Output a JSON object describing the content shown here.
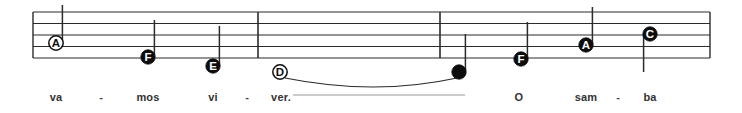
{
  "score": {
    "staff": {
      "left_x": 33,
      "right_x": 710,
      "top_y": 12,
      "line_spacing": 11.5,
      "line_count": 5,
      "line_color": "#2b2b2b"
    },
    "barlines": [
      {
        "name": "barline-1",
        "x": 258
      },
      {
        "name": "barline-2",
        "x": 440
      }
    ],
    "notes": [
      {
        "id": "note-a-1",
        "letter": "A",
        "filled": false,
        "x": 56,
        "y": 43,
        "stem": "up",
        "stem_length": 38,
        "lyric": "va"
      },
      {
        "id": "note-f-1",
        "letter": "F",
        "filled": true,
        "x": 148,
        "y": 57,
        "stem": "up",
        "stem_length": 37,
        "lyric": "mos"
      },
      {
        "id": "note-e-1",
        "letter": "E",
        "filled": true,
        "x": 213,
        "y": 66,
        "stem": "up",
        "stem_length": 40,
        "lyric": "vi"
      },
      {
        "id": "note-d-1",
        "letter": "D",
        "filled": false,
        "x": 280,
        "y": 72,
        "stem": "none",
        "stem_length": 0,
        "lyric": "ver."
      },
      {
        "id": "note-plain-1",
        "letter": "",
        "filled": true,
        "x": 459,
        "y": 72,
        "stem": "up",
        "stem_length": 38,
        "lyric": ""
      },
      {
        "id": "note-f-2",
        "letter": "F",
        "filled": true,
        "x": 521,
        "y": 59,
        "stem": "up",
        "stem_length": 37,
        "lyric": "O"
      },
      {
        "id": "note-a-2",
        "letter": "A",
        "filled": true,
        "x": 586,
        "y": 45,
        "stem": "up",
        "stem_length": 38,
        "lyric": "sam"
      },
      {
        "id": "note-c-1",
        "letter": "C",
        "filled": true,
        "x": 650,
        "y": 34,
        "stem": "down",
        "stem_length": 38,
        "lyric": "ba"
      }
    ],
    "slur": {
      "name": "slur-ver-to-note",
      "start_x": 285,
      "start_y": 78,
      "control_x": 375,
      "control_y": 96,
      "end_x": 457,
      "end_y": 78
    },
    "lyrics": [
      {
        "text": "va",
        "x": 56,
        "y": 91
      },
      {
        "text": "mos",
        "x": 148,
        "y": 91
      },
      {
        "text": "vi",
        "x": 213,
        "y": 91
      },
      {
        "text": "ver.",
        "x": 281,
        "y": 91
      },
      {
        "text": "O",
        "x": 519,
        "y": 91
      },
      {
        "text": "sam",
        "x": 586,
        "y": 91
      },
      {
        "text": "ba",
        "x": 650,
        "y": 91
      }
    ],
    "hyphens": [
      {
        "text": "-",
        "x": 101,
        "y": 91
      },
      {
        "text": "-",
        "x": 247,
        "y": 91
      },
      {
        "text": "-",
        "x": 618,
        "y": 91
      }
    ],
    "extension_line": {
      "name": "lyric-extension-line",
      "start_x": 293,
      "end_x": 465,
      "y": 95,
      "color": "#9a9a9a"
    }
  }
}
